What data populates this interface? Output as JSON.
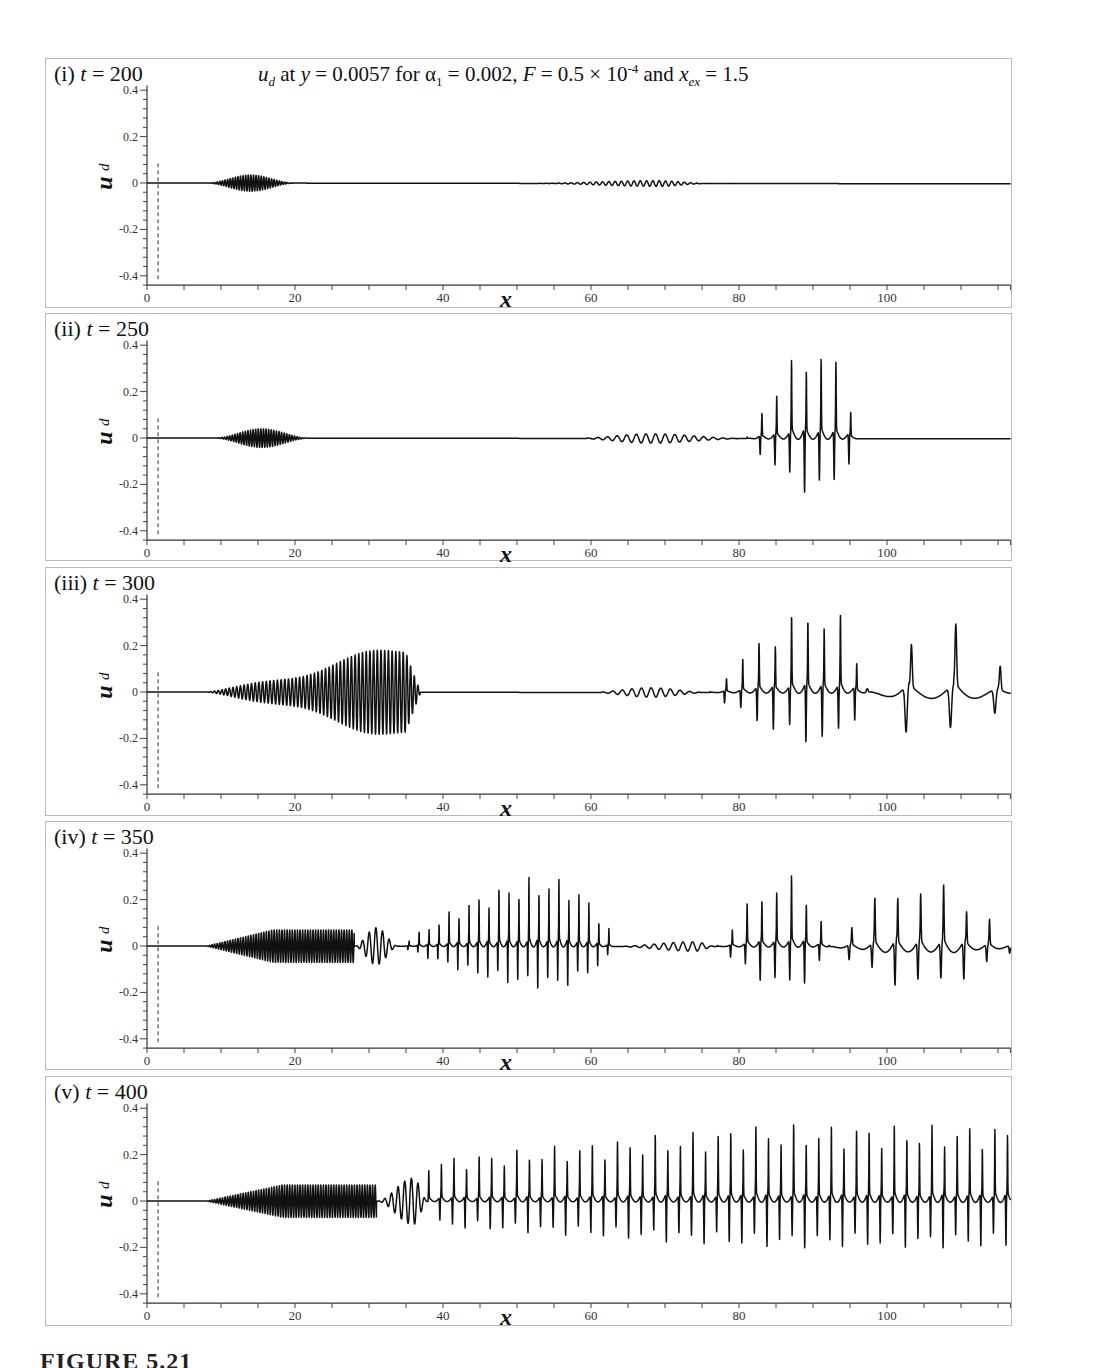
{
  "figure": {
    "suptitle": {
      "var": "u",
      "var_sub": "d",
      "text_1": " at ",
      "y_var": "y",
      "text_2": " = 0.0057 for ",
      "alpha": "α",
      "alpha_sub": "1",
      "text_3": " = 0.002, ",
      "F_var": "F",
      "text_4": " = 0.5 × 10",
      "exp": "-4",
      "text_5": " and ",
      "xex_var": "x",
      "xex_sub": "ex",
      "text_6": " = 1.5"
    },
    "caption": "FIGURE 5.21",
    "line_color": "#111111",
    "frame_color": "#b8b8b8"
  },
  "chart_data": [
    {
      "type": "line",
      "panel": "(i)",
      "t_label": "t",
      "t_value": "= 200",
      "title": "u_d at y = 0.0057 for α1 = 0.002, F = 0.5 × 10^-4 and x_ex = 1.5",
      "xlabel": "x",
      "ylabel": "u_d",
      "xlim": [
        0,
        116.7
      ],
      "ylim": [
        -0.44,
        0.42
      ],
      "xticks": [
        0,
        20,
        40,
        60,
        80,
        100
      ],
      "yticks": [
        "0.4",
        "0.2",
        "0",
        "-0.2",
        "-0.4"
      ],
      "exciter_line_x": 1.5,
      "packets": [
        {
          "x0": 8,
          "x1": 20,
          "amp": 0.035,
          "wl": 0.35,
          "kind": "sym"
        },
        {
          "x0": 52,
          "x1": 76,
          "amp": 0.012,
          "wl": 0.85,
          "kind": "sym",
          "peak": 69
        }
      ]
    },
    {
      "type": "line",
      "panel": "(ii)",
      "t_label": "t",
      "t_value": "= 250",
      "xlabel": "x",
      "ylabel": "u_d",
      "xlim": [
        0,
        116.7
      ],
      "ylim": [
        -0.44,
        0.42
      ],
      "xticks": [
        0,
        20,
        40,
        60,
        80,
        100
      ],
      "yticks": [
        "0.4",
        "0.2",
        "0",
        "-0.2",
        "-0.4"
      ],
      "exciter_line_x": 1.5,
      "packets": [
        {
          "x0": 9,
          "x1": 22,
          "amp": 0.04,
          "wl": 0.35,
          "kind": "sym"
        },
        {
          "x0": 58,
          "x1": 81,
          "amp": 0.02,
          "wl": 1.3,
          "kind": "sym",
          "peak": 68
        },
        {
          "x0": 81,
          "x1": 96,
          "amp": 0.32,
          "wl": 2.0,
          "kind": "spiky",
          "peak": 91
        }
      ]
    },
    {
      "type": "line",
      "panel": "(iii)",
      "t_label": "t",
      "t_value": "= 300",
      "xlabel": "x",
      "ylabel": "u_d",
      "xlim": [
        0,
        116.7
      ],
      "ylim": [
        -0.44,
        0.42
      ],
      "xticks": [
        0,
        20,
        40,
        60,
        80,
        100
      ],
      "yticks": [
        "0.4",
        "0.2",
        "0",
        "-0.2",
        "-0.4"
      ],
      "exciter_line_x": 1.5,
      "packets": [
        {
          "x0": 8,
          "x1": 37,
          "amp": 0.23,
          "wl": 0.5,
          "kind": "grow"
        },
        {
          "x0": 60,
          "x1": 76,
          "amp": 0.02,
          "wl": 1.3,
          "kind": "sym",
          "peak": 68
        },
        {
          "x0": 76,
          "x1": 97,
          "amp": 0.3,
          "wl": 2.2,
          "kind": "spiky",
          "peak": 92
        },
        {
          "x0": 97,
          "x1": 116.7,
          "amp": 0.28,
          "wl": 6.0,
          "kind": "sparse"
        }
      ]
    },
    {
      "type": "line",
      "panel": "(iv)",
      "t_label": "t",
      "t_value": "= 350",
      "xlabel": "x",
      "ylabel": "u_d",
      "xlim": [
        0,
        116.7
      ],
      "ylim": [
        -0.44,
        0.42
      ],
      "xticks": [
        0,
        20,
        40,
        60,
        80,
        100
      ],
      "yticks": [
        "0.4",
        "0.2",
        "0",
        "-0.2",
        "-0.4"
      ],
      "exciter_line_x": 1.5,
      "packets": [
        {
          "x0": 8,
          "x1": 28,
          "amp": 0.07,
          "wl": 0.35,
          "kind": "dense"
        },
        {
          "x0": 28,
          "x1": 34,
          "amp": 0.08,
          "wl": 0.9,
          "kind": "sym",
          "peak": 31
        },
        {
          "x0": 34,
          "x1": 63,
          "amp": 0.24,
          "wl": 1.35,
          "kind": "spiky",
          "peak": 55
        },
        {
          "x0": 63,
          "x1": 77,
          "amp": 0.02,
          "wl": 1.3,
          "kind": "sym",
          "peak": 74
        },
        {
          "x0": 77,
          "x1": 92,
          "amp": 0.24,
          "wl": 2.0,
          "kind": "spiky",
          "peak": 87
        },
        {
          "x0": 92,
          "x1": 116.7,
          "amp": 0.23,
          "wl": 3.1,
          "kind": "sparse"
        }
      ]
    },
    {
      "type": "line",
      "panel": "(v)",
      "t_label": "t",
      "t_value": "= 400",
      "xlabel": "x",
      "ylabel": "u_d",
      "xlim": [
        0,
        116.7
      ],
      "ylim": [
        -0.44,
        0.42
      ],
      "xticks": [
        0,
        20,
        40,
        60,
        80,
        100
      ],
      "yticks": [
        "0.4",
        "0.2",
        "0",
        "-0.2",
        "-0.4"
      ],
      "exciter_line_x": 1.5,
      "packets": [
        {
          "x0": 8,
          "x1": 31,
          "amp": 0.07,
          "wl": 0.35,
          "kind": "dense"
        },
        {
          "x0": 31,
          "x1": 38,
          "amp": 0.1,
          "wl": 0.9,
          "kind": "sym",
          "peak": 36
        },
        {
          "x0": 38,
          "x1": 116.7,
          "amp": 0.26,
          "wl": 1.7,
          "kind": "spiky",
          "peak": 78,
          "flat": 1
        }
      ]
    }
  ]
}
